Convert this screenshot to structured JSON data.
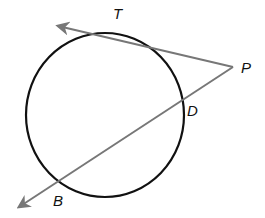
{
  "diagram": {
    "circle": {
      "cx": 105,
      "cy": 115,
      "rx": 79,
      "ry": 82,
      "stroke": "#111111"
    },
    "lines_color": "#777777",
    "points": {
      "T": {
        "label": "T",
        "x": 100,
        "y": 34
      },
      "P": {
        "label": "P",
        "x": 233,
        "y": 67
      },
      "D": {
        "label": "D",
        "x": 183,
        "y": 104
      },
      "B": {
        "label": "B",
        "x": 60,
        "y": 182
      }
    },
    "tangent_ray": {
      "from": "P",
      "through": "T",
      "arrow_tip": [
        56,
        26
      ]
    },
    "secant_ray": {
      "from": "P",
      "through": [
        "D",
        "B"
      ],
      "arrow_tip": [
        17,
        208
      ]
    }
  }
}
